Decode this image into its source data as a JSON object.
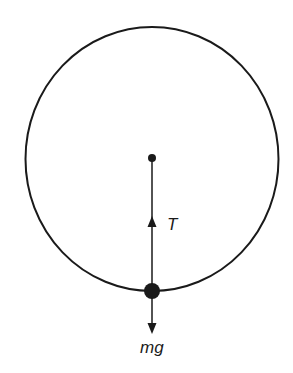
{
  "diagram": {
    "type": "free-body diagram",
    "colors": {
      "stroke": "#1a1a1a",
      "background": "#ffffff"
    },
    "circle": {
      "cx": 152,
      "cy": 159,
      "rx": 126.5,
      "ry": 132
    },
    "center_point": {
      "x": 152,
      "y": 158,
      "r": 4
    },
    "mass": {
      "x": 152,
      "y": 291,
      "r": 8
    },
    "forces": [
      {
        "name": "tension",
        "label": "T",
        "direction": "up",
        "from": [
          152,
          291
        ],
        "to": [
          152,
          158
        ],
        "arrow_tip": [
          152,
          216
        ]
      },
      {
        "name": "weight",
        "label": "mg",
        "direction": "down",
        "from": [
          152,
          291
        ],
        "to": [
          152,
          333
        ]
      }
    ],
    "labels": {
      "tension": "T",
      "weight": "mg"
    }
  }
}
